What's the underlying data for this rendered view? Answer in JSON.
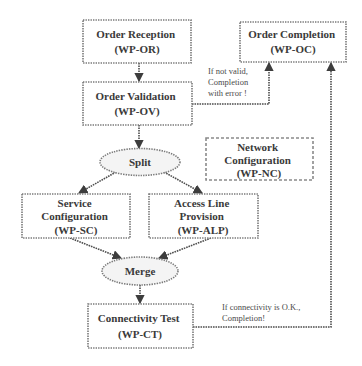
{
  "diagram": {
    "type": "workflow-diagram",
    "colors": {
      "background": "#ffffff",
      "node_border": "#7a7a7a",
      "edge": "#4d4d4d",
      "text": "#3a3a3a",
      "oval_fill": "#f4f4f4"
    }
  },
  "nodes": [
    {
      "id": "WP-OR",
      "shape": "rect",
      "lines": [
        "Order Reception",
        "(WP-OR)"
      ]
    },
    {
      "id": "WP-OV",
      "shape": "rect",
      "lines": [
        "Order Validation",
        "(WP-OV)"
      ]
    },
    {
      "id": "WP-OC",
      "shape": "rect",
      "lines": [
        "Order Completion",
        "(WP-OC)"
      ]
    },
    {
      "id": "split",
      "shape": "ellipse",
      "lines": [
        "Split"
      ]
    },
    {
      "id": "WP-NC",
      "shape": "rect-dashed",
      "lines": [
        "Network",
        "Configuration",
        "(WP-NC)"
      ]
    },
    {
      "id": "WP-SC",
      "shape": "rect",
      "lines": [
        "Service",
        "Configuration",
        "(WP-SC)"
      ]
    },
    {
      "id": "WP-ALP",
      "shape": "rect",
      "lines": [
        "Access Line",
        "Provision",
        "(WP-ALP)"
      ]
    },
    {
      "id": "merge",
      "shape": "ellipse",
      "lines": [
        "Merge"
      ]
    },
    {
      "id": "WP-CT",
      "shape": "rect",
      "lines": [
        "Connectivity Test",
        "(WP-CT)"
      ]
    }
  ],
  "edges": [
    {
      "from": "WP-OR",
      "to": "WP-OV",
      "label": []
    },
    {
      "from": "WP-OV",
      "to": "split",
      "label": []
    },
    {
      "from": "WP-OV",
      "to": "WP-OC",
      "label": [
        "If not valid,",
        "Completion",
        "with error !"
      ]
    },
    {
      "from": "split",
      "to": "WP-SC",
      "label": []
    },
    {
      "from": "split",
      "to": "WP-ALP",
      "label": []
    },
    {
      "from": "WP-SC",
      "to": "merge",
      "label": []
    },
    {
      "from": "WP-ALP",
      "to": "merge",
      "label": []
    },
    {
      "from": "merge",
      "to": "WP-CT",
      "label": []
    },
    {
      "from": "WP-CT",
      "to": "WP-OC",
      "label": [
        "If connectivity is O.K.,",
        "Completion!"
      ]
    }
  ]
}
